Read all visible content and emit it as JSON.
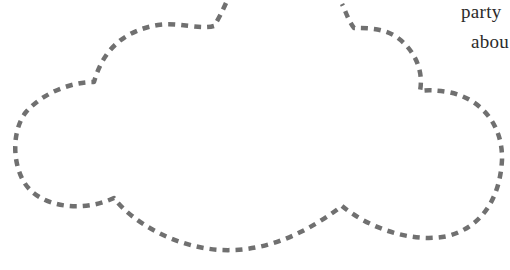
{
  "illustration": {
    "shape": "cloud-outline",
    "stroke_color": "#707070",
    "stroke_style": "dashed",
    "background": "#ffffff"
  },
  "text": {
    "line1": "party",
    "line2": "abou"
  }
}
